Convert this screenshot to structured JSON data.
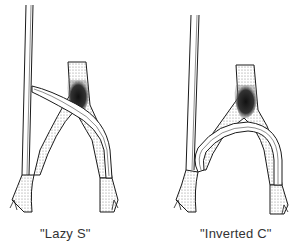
{
  "figure": {
    "panels": [
      {
        "id": "lazy-s",
        "caption": "\"Lazy S\"",
        "graft_shape": "S-curve crossing"
      },
      {
        "id": "inverted-c",
        "caption": "\"Inverted C\"",
        "graft_shape": "arched C-loop"
      }
    ],
    "colors": {
      "line": "#1a1a1a",
      "shade": "#2b2b2b",
      "background": "#ffffff"
    }
  }
}
